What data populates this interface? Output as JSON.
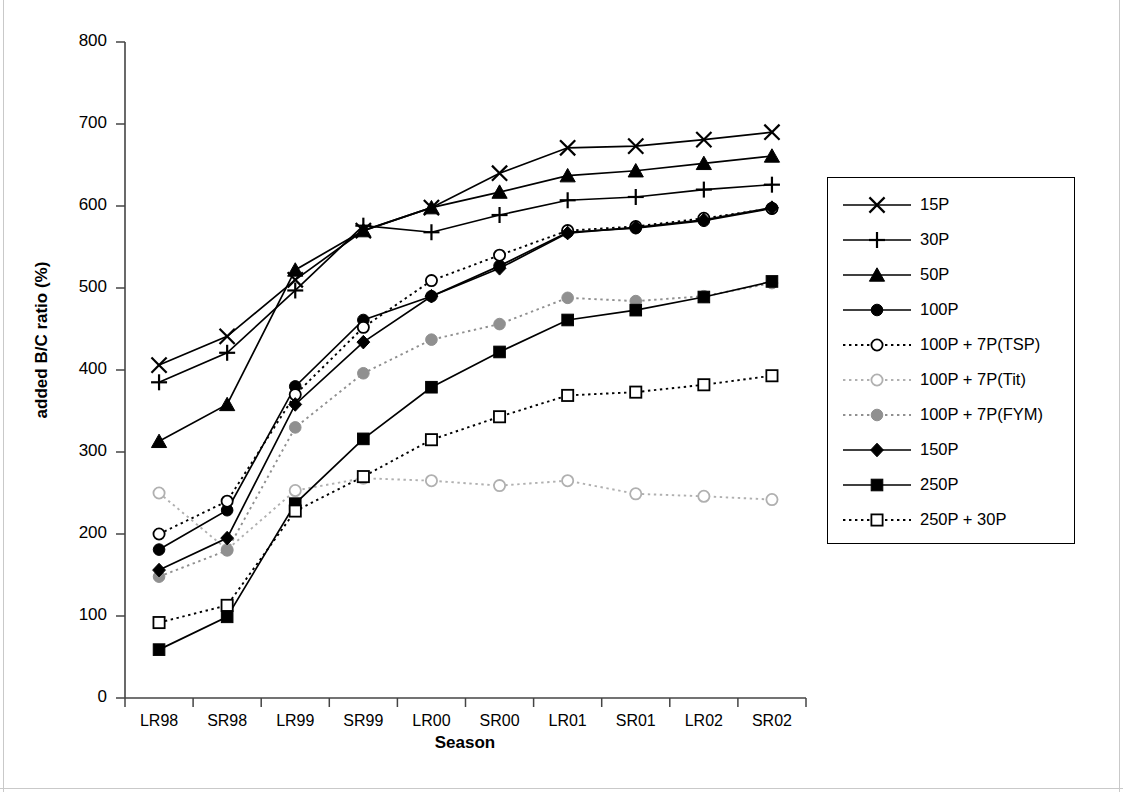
{
  "chart_data": {
    "type": "line",
    "title": "",
    "xlabel": "Season",
    "ylabel": "added B/C ratio (%)",
    "categories": [
      "LR98",
      "SR98",
      "LR99",
      "SR99",
      "LR00",
      "SR00",
      "LR01",
      "SR01",
      "LR02",
      "SR02"
    ],
    "ylim": [
      0,
      800
    ],
    "yticks": [
      0,
      100,
      200,
      300,
      400,
      500,
      600,
      700,
      800
    ],
    "grid": false,
    "legend_position": "right",
    "series": [
      {
        "name": "15P",
        "marker": "cross-x",
        "line": "solid",
        "color": "#000000",
        "values": [
          406,
          441,
          510,
          570,
          598,
          640,
          671,
          673,
          681,
          690
        ]
      },
      {
        "name": "30P",
        "marker": "plus",
        "line": "solid",
        "color": "#000000",
        "values": [
          385,
          421,
          497,
          576,
          568,
          589,
          607,
          611,
          620,
          626
        ]
      },
      {
        "name": "50P",
        "marker": "triangle",
        "line": "solid",
        "color": "#000000",
        "values": [
          313,
          358,
          522,
          570,
          598,
          617,
          637,
          643,
          652,
          661
        ]
      },
      {
        "name": "100P",
        "marker": "circle-filled",
        "line": "solid",
        "color": "#000000",
        "values": [
          181,
          229,
          380,
          461,
          490,
          527,
          568,
          573,
          582,
          597
        ]
      },
      {
        "name": "100P + 7P(TSP)",
        "marker": "circle-open",
        "line": "dotted",
        "color": "#000000",
        "values": [
          200,
          240,
          370,
          452,
          509,
          540,
          570,
          575,
          585,
          597
        ]
      },
      {
        "name": "100P + 7P(Tit)",
        "marker": "circle-open",
        "line": "dotted",
        "color": "#b0b0b0",
        "values": [
          250,
          181,
          253,
          268,
          265,
          259,
          265,
          249,
          246,
          242
        ]
      },
      {
        "name": "100P + 7P(FYM)",
        "marker": "circle-filled",
        "line": "dotted",
        "color": "#909090",
        "values": [
          148,
          180,
          330,
          396,
          437,
          456,
          488,
          484,
          490,
          506
        ]
      },
      {
        "name": "150P",
        "marker": "diamond",
        "line": "solid",
        "color": "#000000",
        "values": [
          156,
          195,
          358,
          434,
          490,
          524,
          567,
          574,
          583,
          598
        ]
      },
      {
        "name": "250P",
        "marker": "square-filled",
        "line": "solid",
        "color": "#000000",
        "values": [
          59,
          99,
          237,
          316,
          379,
          422,
          461,
          473,
          489,
          508
        ]
      },
      {
        "name": "250P + 30P",
        "marker": "square-open",
        "line": "dotted",
        "color": "#000000",
        "values": [
          92,
          113,
          228,
          270,
          315,
          343,
          369,
          373,
          382,
          393
        ]
      }
    ]
  },
  "axis": {
    "y_title": "added B/C ratio (%)",
    "x_title": "Season",
    "y_tick_labels": [
      "800",
      "700",
      "600",
      "500",
      "400",
      "300",
      "200",
      "100",
      "0"
    ],
    "x_tick_labels": [
      "LR98",
      "SR98",
      "LR99",
      "SR99",
      "LR00",
      "SR00",
      "LR01",
      "SR01",
      "LR02",
      "SR02"
    ]
  },
  "legend": {
    "items": [
      {
        "label": "15P"
      },
      {
        "label": "30P"
      },
      {
        "label": "50P"
      },
      {
        "label": "100P"
      },
      {
        "label": "100P + 7P(TSP)"
      },
      {
        "label": "100P + 7P(Tit)"
      },
      {
        "label": "100P + 7P(FYM)"
      },
      {
        "label": "150P"
      },
      {
        "label": "250P"
      },
      {
        "label": "250P + 30P"
      }
    ]
  }
}
